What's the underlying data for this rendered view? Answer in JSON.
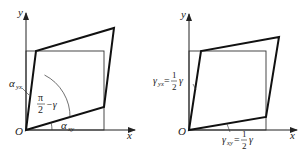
{
  "diagrams": [
    {
      "id": "left",
      "axis_x_label": "x",
      "axis_y_label": "y",
      "origin_label": "O",
      "alpha_yx": {
        "base": "α",
        "sub": "yx"
      },
      "alpha_xy": {
        "base": "α",
        "sub": "xy"
      },
      "angle_label": {
        "num": "π",
        "den": "2",
        "rest": "−γ"
      }
    },
    {
      "id": "right",
      "axis_x_label": "x",
      "axis_y_label": "y",
      "origin_label": "O",
      "gamma_yx": {
        "base": "γ",
        "sub": "yx",
        "eq": "=",
        "num": "1",
        "den": "2",
        "rest": "γ"
      },
      "gamma_xy": {
        "base": "γ",
        "sub": "xy",
        "eq": "=",
        "num": "1",
        "den": "2",
        "rest": "γ"
      }
    }
  ],
  "colors": {
    "stroke": "#222222",
    "background": "#ffffff"
  }
}
